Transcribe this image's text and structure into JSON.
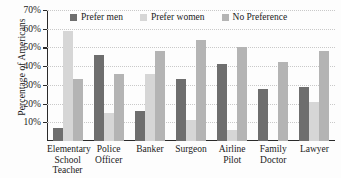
{
  "chart_data": {
    "type": "bar",
    "title": "",
    "xlabel": "",
    "ylabel": "Percentage of Americans",
    "ylim": [
      0,
      70
    ],
    "ytick_labels": [
      "70%",
      "60%",
      "50%",
      "40%",
      "30%",
      "20%",
      "10%"
    ],
    "yticks": [
      70,
      60,
      50,
      40,
      30,
      20,
      10
    ],
    "grid": true,
    "legend_position": "top-center",
    "categories": [
      "Elementary School Teacher",
      "Police Officer",
      "Banker",
      "Surgeon",
      "Airline Pilot",
      "Family Doctor",
      "Lawyer"
    ],
    "category_lines": [
      [
        "Elementary",
        "School",
        "Teacher"
      ],
      [
        "Police",
        "Officer"
      ],
      [
        "Banker"
      ],
      [
        "Surgeon"
      ],
      [
        "Airline",
        "Pilot"
      ],
      [
        "Family",
        "Doctor"
      ],
      [
        "Lawyer"
      ]
    ],
    "series": [
      {
        "name": "Prefer men",
        "color": "#6e6e6e",
        "values": [
          7,
          46,
          16,
          33,
          41,
          28,
          29
        ]
      },
      {
        "name": "Prefer women",
        "color": "#d6d6d6",
        "values": [
          59,
          15,
          36,
          11,
          6,
          0,
          21
        ]
      },
      {
        "name": "No Preference",
        "color": "#b4b4b4",
        "values": [
          33,
          36,
          48,
          54,
          50,
          42,
          48
        ]
      }
    ]
  }
}
